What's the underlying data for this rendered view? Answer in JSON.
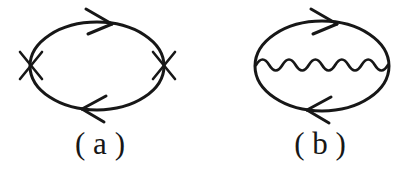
{
  "figure": {
    "background_color": "#ffffff",
    "stroke_color": "#171717",
    "width": 412,
    "height": 176,
    "panels": [
      {
        "id": "a",
        "label": "( a )",
        "description": "fermion loop with two cross vertices",
        "loop": {
          "center_x": 97,
          "center_y": 66,
          "radius_x": 67,
          "radius_y": 44,
          "stroke_width": 3.0
        },
        "arrows": [
          {
            "name": "top-arrowhead",
            "direction": "right",
            "x": 104,
            "y": 23
          },
          {
            "name": "bottom-arrowhead",
            "direction": "left",
            "x": 92,
            "y": 109
          }
        ],
        "vertices": [
          {
            "name": "cross-vertex-left",
            "symbol": "cross",
            "x": 31,
            "y": 65
          },
          {
            "name": "cross-vertex-right",
            "symbol": "cross",
            "x": 164,
            "y": 65
          }
        ]
      },
      {
        "id": "b",
        "label": "( b )",
        "description": "fermion loop with internal wavy interaction line",
        "loop": {
          "center_x": 322,
          "center_y": 66,
          "radius_x": 67,
          "radius_y": 45,
          "stroke_width": 3.0
        },
        "arrows": [
          {
            "name": "top-arrowhead",
            "direction": "right",
            "x": 329,
            "y": 23
          },
          {
            "name": "bottom-arrowhead",
            "direction": "left",
            "x": 317,
            "y": 110
          }
        ],
        "wavy_line": {
          "name": "interaction-wavy-line",
          "x_start": 256,
          "x_end": 388,
          "y": 65,
          "periods": 5,
          "amplitude": 7,
          "stroke_width": 2.6
        }
      }
    ]
  },
  "labels": {
    "panel_a": "( a )",
    "panel_b": "( b )"
  }
}
